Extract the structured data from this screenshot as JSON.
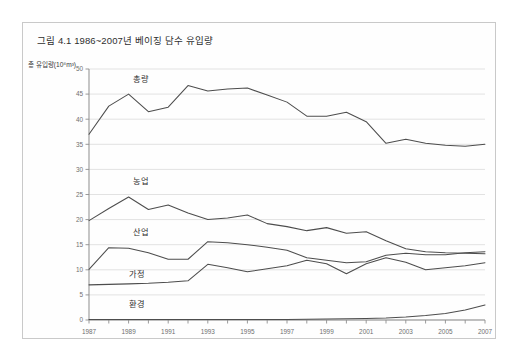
{
  "figure": {
    "title": "그림 4.1 1986~2007년 베이징 담수 유입량",
    "y_axis_label": "총 유입량(10⁸m³)"
  },
  "chart_data": {
    "type": "line",
    "title": "그림 4.1 1986~2007년 베이징 담수 유입량",
    "xlabel": "",
    "ylabel": "총 유입량(10⁸m³)",
    "xlim": [
      1987,
      2007
    ],
    "ylim": [
      0,
      50
    ],
    "ytick_step": 5,
    "grid": true,
    "legend": "inline-labels",
    "x": [
      1987,
      1988,
      1989,
      1990,
      1991,
      1992,
      1993,
      1994,
      1995,
      1996,
      1997,
      1998,
      1999,
      2000,
      2001,
      2002,
      2003,
      2004,
      2005,
      2006,
      2007
    ],
    "ytick_labels": [
      "0",
      "5",
      "10",
      "15",
      "20",
      "25",
      "30",
      "35",
      "40",
      "45",
      "50"
    ],
    "xtick_labels": [
      "1987",
      "1989",
      "1991",
      "1993",
      "1995",
      "1997",
      "1999",
      "2001",
      "2003",
      "2005",
      "2007"
    ],
    "series": [
      {
        "name": "총량",
        "label": "총량",
        "color": "#4d4d4d",
        "values": [
          37.0,
          42.6,
          45.0,
          41.5,
          42.4,
          46.7,
          45.6,
          46.0,
          46.2,
          44.8,
          43.4,
          40.6,
          40.6,
          41.4,
          39.5,
          35.2,
          36.0,
          35.2,
          34.8,
          34.6,
          35.0
        ]
      },
      {
        "name": "농업",
        "label": "농업",
        "color": "#4d4d4d",
        "values": [
          19.8,
          22.2,
          24.5,
          22.0,
          22.9,
          21.3,
          20.0,
          20.3,
          20.9,
          19.2,
          18.6,
          17.8,
          18.4,
          17.3,
          17.6,
          15.8,
          14.2,
          13.6,
          13.4,
          13.3,
          13.2
        ]
      },
      {
        "name": "산업",
        "label": "산업",
        "color": "#4d4d4d",
        "values": [
          10.1,
          14.4,
          14.3,
          13.4,
          12.1,
          12.1,
          15.6,
          15.4,
          15.0,
          14.5,
          13.9,
          12.4,
          11.9,
          11.4,
          11.6,
          12.9,
          13.3,
          13.0,
          13.0,
          13.4,
          13.6
        ]
      },
      {
        "name": "가정",
        "label": "가정",
        "color": "#4d4d4d",
        "values": [
          7.0,
          7.1,
          7.2,
          7.3,
          7.5,
          7.8,
          11.1,
          10.4,
          9.6,
          10.2,
          10.8,
          11.9,
          11.2,
          9.2,
          11.2,
          12.4,
          11.5,
          10.0,
          10.4,
          10.8,
          11.4
        ]
      },
      {
        "name": "환경",
        "label": "환경",
        "color": "#4d4d4d",
        "values": [
          0.1,
          0.1,
          0.1,
          0.1,
          0.1,
          0.1,
          0.1,
          0.1,
          0.1,
          0.1,
          0.1,
          0.15,
          0.2,
          0.25,
          0.3,
          0.4,
          0.6,
          0.9,
          1.3,
          2.0,
          3.0
        ]
      }
    ],
    "series_label_positions": [
      {
        "name": "총량",
        "x": 1989.2,
        "y": 47.5
      },
      {
        "name": "농업",
        "x": 1989.2,
        "y": 27.0
      },
      {
        "name": "산업",
        "x": 1989.2,
        "y": 16.9
      },
      {
        "name": "가정",
        "x": 1989.0,
        "y": 8.6
      },
      {
        "name": "환경",
        "x": 1989.0,
        "y": 2.6
      }
    ]
  }
}
